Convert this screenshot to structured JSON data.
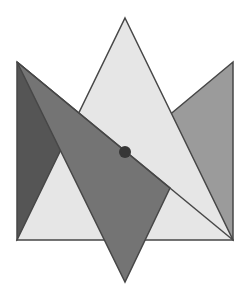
{
  "diagram": {
    "type": "geometric-figure",
    "colors": {
      "background": "#ffffff",
      "light": "#e6e6e6",
      "right_gray": "#9b9b9b",
      "medium": "#747474",
      "dark": "#555555",
      "stroke": "#474747",
      "center_dot": "#363636"
    },
    "shapes": [
      {
        "name": "left-dark-triangle",
        "points": "17,62 17,240 125,152"
      },
      {
        "name": "right-gray-triangle",
        "points": "233,62 233,240 125,152"
      },
      {
        "name": "light-upward-triangle",
        "points": "125,18 233,240 17,240"
      },
      {
        "name": "medium-downward-triangle",
        "points": "17,62 170,188 125,282"
      }
    ],
    "center_point": {
      "x": 125,
      "y": 152,
      "r": 6
    }
  }
}
